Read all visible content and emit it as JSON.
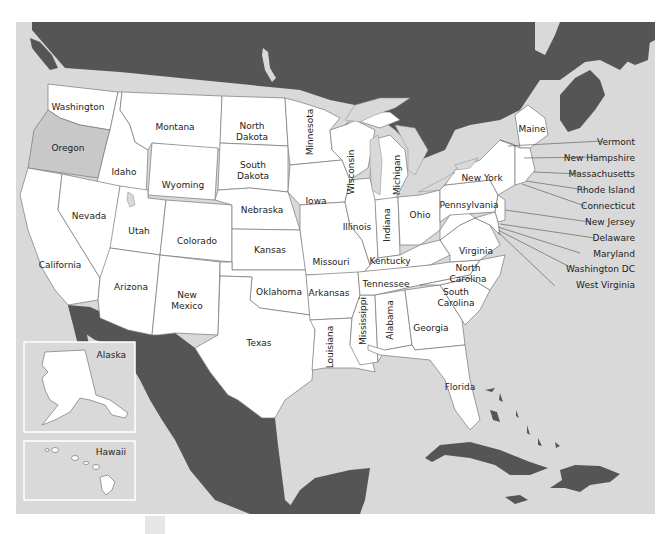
{
  "map": {
    "title": "United States",
    "colors": {
      "water": "#d9d9d9",
      "foreign_land": "#555555",
      "state_fill": "#ffffff",
      "highlight_fill": "#c8c8c8",
      "border": "#777777"
    },
    "highlighted_state": "Oregon",
    "states": {
      "washington": "Washington",
      "oregon": "Oregon",
      "california": "California",
      "idaho": "Idaho",
      "nevada": "Nevada",
      "montana": "Montana",
      "wyoming": "Wyoming",
      "utah": "Utah",
      "arizona": "Arizona",
      "colorado": "Colorado",
      "new_mexico_1": "New",
      "new_mexico_2": "Mexico",
      "north_dakota_1": "North",
      "north_dakota_2": "Dakota",
      "south_dakota_1": "South",
      "south_dakota_2": "Dakota",
      "nebraska": "Nebraska",
      "kansas": "Kansas",
      "oklahoma": "Oklahoma",
      "texas": "Texas",
      "minnesota": "Minnesota",
      "iowa": "Iowa",
      "missouri": "Missouri",
      "arkansas": "Arkansas",
      "louisiana": "Louisiana",
      "wisconsin": "Wisconsin",
      "illinois": "Illinois",
      "mississippi": "Mississippi",
      "michigan": "Michigan",
      "indiana": "Indiana",
      "kentucky": "Kentucky",
      "tennessee": "Tennessee",
      "alabama": "Alabama",
      "ohio": "Ohio",
      "georgia": "Georgia",
      "florida": "Florida",
      "south_carolina_1": "South",
      "south_carolina_2": "Carolina",
      "north_carolina_1": "North",
      "north_carolina_2": "Carolina",
      "virginia": "Virginia",
      "pennsylvania": "Pennsylvania",
      "new_york": "New York",
      "maine": "Maine"
    },
    "callouts": [
      "Vermont",
      "New Hampshire",
      "Massachusetts",
      "Rhode Island",
      "Connecticut",
      "New Jersey",
      "Delaware",
      "Maryland",
      "Washington DC",
      "West Virginia"
    ],
    "insets": {
      "alaska": "Alaska",
      "hawaii": "Hawaii"
    }
  }
}
